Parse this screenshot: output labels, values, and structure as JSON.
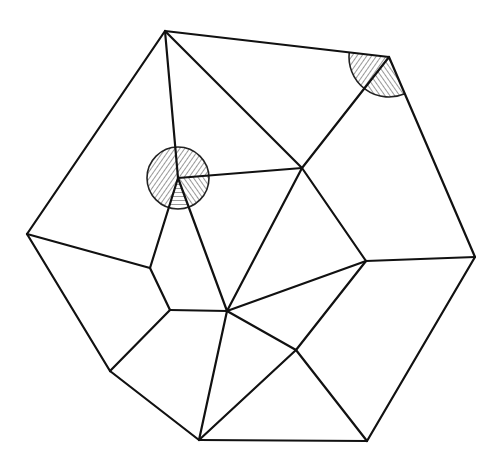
{
  "diagram": {
    "type": "planar-graph-triangulation",
    "stroke_color": "#111111",
    "background": "#ffffff",
    "vertices": {
      "A": [
        165,
        31
      ],
      "B": [
        389,
        57
      ],
      "C": [
        475,
        257
      ],
      "D": [
        367,
        441
      ],
      "E": [
        199,
        440
      ],
      "F": [
        110,
        371
      ],
      "G": [
        27,
        234
      ],
      "H": [
        178,
        178
      ],
      "I": [
        302,
        168
      ],
      "J": [
        366,
        261
      ],
      "K": [
        227,
        311
      ],
      "L": [
        150,
        268
      ],
      "M": [
        170,
        310
      ],
      "N": [
        296,
        350
      ]
    },
    "edges": [
      [
        "A",
        "B"
      ],
      [
        "B",
        "C"
      ],
      [
        "C",
        "D"
      ],
      [
        "D",
        "E"
      ],
      [
        "E",
        "F"
      ],
      [
        "F",
        "G"
      ],
      [
        "G",
        "A"
      ],
      [
        "A",
        "H"
      ],
      [
        "A",
        "I"
      ],
      [
        "H",
        "I"
      ],
      [
        "B",
        "I"
      ],
      [
        "I",
        "K"
      ],
      [
        "I",
        "J"
      ],
      [
        "J",
        "C"
      ],
      [
        "J",
        "K"
      ],
      [
        "H",
        "L"
      ],
      [
        "H",
        "K"
      ],
      [
        "L",
        "G"
      ],
      [
        "L",
        "M"
      ],
      [
        "M",
        "K"
      ],
      [
        "M",
        "F"
      ],
      [
        "K",
        "E"
      ],
      [
        "K",
        "N"
      ],
      [
        "J",
        "N"
      ],
      [
        "N",
        "E"
      ],
      [
        "N",
        "D"
      ]
    ],
    "highlighted_angles": [
      {
        "vertex": "H",
        "radius": 31,
        "note": "full disc, hatched, divided by incident edges"
      },
      {
        "vertex": "B",
        "radius": 40,
        "note": "sector between BA and BC, hatched, divided by edge BI"
      }
    ]
  }
}
